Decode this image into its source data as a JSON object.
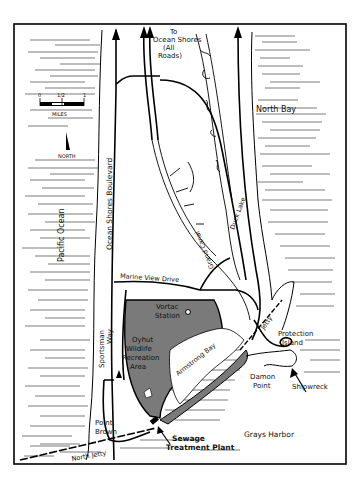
{
  "map": {
    "title": "",
    "labels": {
      "to_ocean_shores": [
        "To",
        "Ocean Shores",
        "(All",
        "Roads)"
      ],
      "north_bay": "North Bay",
      "pacific_ocean": "Pacific Ocean",
      "ocean_shores_boulevard": "Ocean Shores Boulevard",
      "grand_canal": "Grand Canal",
      "duck_lake": "Duck Lake",
      "marine_view_drive": "Marine View Drive",
      "sportsman_way": [
        "Sportsman",
        "Way"
      ],
      "vortac_station": [
        "Vortac",
        "Station"
      ],
      "oyhut_wildlife": [
        "Oyhut",
        "Wildlife",
        "Recreation",
        "Area"
      ],
      "armstrong_bay": "Armstrong Bay",
      "jetty": "Jetty",
      "protection_island": [
        "Protection",
        "Island"
      ],
      "damon_point": [
        "Damon",
        "Point"
      ],
      "shipwreck": "Shipwreck",
      "point_brown": [
        "Point",
        "Brown"
      ],
      "sewage_plant": [
        "Sewage",
        "Treatment Plant"
      ],
      "grays_harbor": "Grays Harbor",
      "north_jetty": "North Jetty"
    },
    "scale": {
      "ticks": [
        "0",
        "1/2",
        "1"
      ],
      "unit": "MILES"
    },
    "north_arrow": {
      "label": "NORTH"
    },
    "colors": {
      "ink": "#000000",
      "wildlife_area_fill": "#7a7a7a",
      "background": "#ffffff"
    }
  }
}
